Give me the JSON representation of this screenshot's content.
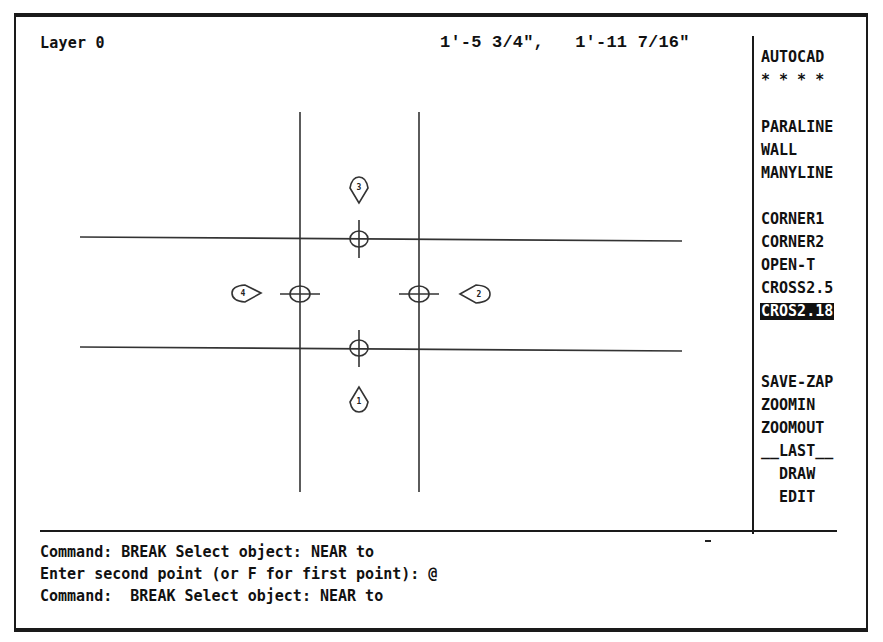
{
  "status": {
    "layer": "Layer 0",
    "coordinates": "1'-5 3/4\",   1'-11 7/16\""
  },
  "screen_menu": {
    "title": "AUTOCAD",
    "stars": "* * * *",
    "items": [
      {
        "label": "PARALINE",
        "top": 119
      },
      {
        "label": "WALL",
        "top": 142
      },
      {
        "label": "MANYLINE",
        "top": 165
      },
      {
        "label": "CORNER1",
        "top": 211
      },
      {
        "label": "CORNER2",
        "top": 234
      },
      {
        "label": "OPEN-T",
        "top": 257
      },
      {
        "label": "CROSS2.5",
        "top": 280
      },
      {
        "label": "CROS2.18",
        "top": 303,
        "selected": true
      },
      {
        "label": "SAVE-ZAP",
        "top": 374
      },
      {
        "label": "ZOOMIN",
        "top": 397
      },
      {
        "label": "ZOOMOUT",
        "top": 420
      },
      {
        "label": "__LAST__",
        "top": 443
      },
      {
        "label": "  DRAW",
        "top": 466
      },
      {
        "label": "  EDIT",
        "top": 489
      }
    ]
  },
  "command_area": {
    "lines": [
      "Command: BREAK Select object: NEAR to",
      "Enter second point (or F for first point): @",
      "Command:  BREAK Select object: NEAR to"
    ]
  },
  "drawing": {
    "markers": [
      "1",
      "2",
      "3",
      "4"
    ],
    "line_color": "#333333"
  }
}
